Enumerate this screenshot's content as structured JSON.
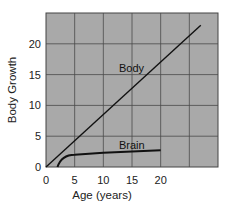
{
  "chart_data": {
    "type": "line",
    "title": "",
    "xlabel": "Age (years)",
    "ylabel": "Body Growth",
    "xlim": [
      0,
      30
    ],
    "ylim": [
      0,
      25
    ],
    "x_ticks": [
      "0",
      "5",
      "10",
      "15",
      "20"
    ],
    "y_ticks": [
      "0",
      "5",
      "10",
      "15",
      "20"
    ],
    "grid": true,
    "legend": "inline labels",
    "series": [
      {
        "name": "Body",
        "label": "Body",
        "x": [
          0,
          27
        ],
        "values": [
          0,
          23
        ]
      },
      {
        "name": "Brain",
        "label": "Brain",
        "x": [
          2,
          3,
          4,
          5,
          10,
          15,
          20
        ],
        "values": [
          0,
          1.1,
          1.7,
          2.0,
          2.3,
          2.5,
          2.7
        ]
      }
    ]
  },
  "colors": {
    "plot_background": "#a9a9a9",
    "grid": "#4a4a4a",
    "line": "#111111"
  }
}
